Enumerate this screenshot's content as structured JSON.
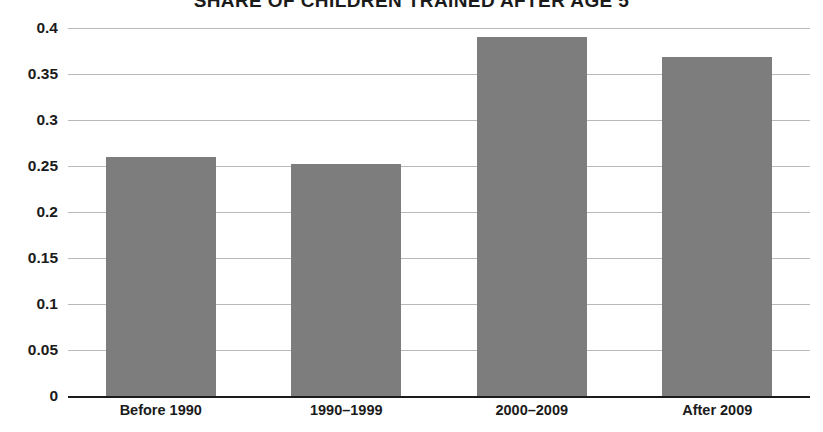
{
  "chart_data": {
    "type": "bar",
    "title": "SHARE OF CHILDREN TRAINED AFTER AGE 5",
    "xlabel": "",
    "ylabel": "",
    "categories": [
      "Before 1990",
      "1990–1999",
      "2000–2009",
      "After 2009"
    ],
    "values": [
      0.26,
      0.252,
      0.39,
      0.368
    ],
    "ylim": [
      0,
      0.4
    ],
    "yticks": [
      0,
      0.05,
      0.1,
      0.15,
      0.2,
      0.25,
      0.3,
      0.35,
      0.4
    ],
    "ytick_labels": [
      "0",
      "0.05",
      "0.1",
      "0.15",
      "0.2",
      "0.25",
      "0.3",
      "0.35",
      "0.4"
    ],
    "grid": true,
    "legend": "none",
    "series": [
      {
        "name": "Share of children trained after age 5",
        "values": [
          0.26,
          0.252,
          0.39,
          0.368
        ]
      }
    ],
    "colors": {
      "bar": "#7d7d7d",
      "gridline": "#b9b9b9",
      "axis": "#1b1b1b",
      "text": "#1b1b1b",
      "background": "#ffffff"
    }
  }
}
